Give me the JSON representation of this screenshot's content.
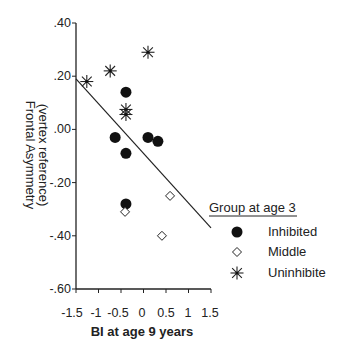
{
  "chart_data": {
    "type": "scatter",
    "title": "",
    "xlabel": "BI at age 9 years",
    "ylabel_line1": "Frontal Asymmetry",
    "ylabel_line2": "(vertex reference)",
    "xlim": [
      -1.5,
      1.5
    ],
    "ylim": [
      -0.6,
      0.4
    ],
    "x_ticks": [
      "-1.5",
      "-1",
      "-0.5",
      "0",
      "0.5",
      "1",
      "1.5"
    ],
    "x_tick_values": [
      -1.5,
      -1,
      -0.5,
      0,
      0.5,
      1,
      1.5
    ],
    "y_ticks": [
      ".40",
      ".20",
      ".00",
      "-.20",
      "-.40",
      "-.60"
    ],
    "y_tick_values": [
      0.4,
      0.2,
      0.0,
      -0.2,
      -0.4,
      -0.6
    ],
    "grid": false,
    "legend": {
      "title": "Group at age 3",
      "position": "right",
      "entries": [
        "Inhibited",
        "Middle",
        "Uninhibite"
      ]
    },
    "series": [
      {
        "name": "Inhibited",
        "marker": "filled-circle",
        "points": [
          [
            -0.39,
            0.14
          ],
          [
            -0.63,
            -0.03
          ],
          [
            -0.39,
            -0.09
          ],
          [
            0.1,
            -0.03
          ],
          [
            0.32,
            -0.045
          ],
          [
            -0.39,
            -0.28
          ]
        ]
      },
      {
        "name": "Middle",
        "marker": "open-diamond",
        "points": [
          [
            -0.41,
            -0.31
          ],
          [
            0.59,
            -0.25
          ],
          [
            0.41,
            -0.4
          ]
        ]
      },
      {
        "name": "Uninhibite",
        "marker": "asterisk",
        "points": [
          [
            -1.26,
            0.18
          ],
          [
            -0.74,
            0.22
          ],
          [
            -0.39,
            0.075
          ],
          [
            -0.39,
            0.056
          ],
          [
            0.1,
            0.29
          ]
        ]
      }
    ],
    "fit_line": {
      "from": [
        -1.5,
        0.19
      ],
      "to": [
        1.5,
        -0.37
      ]
    }
  }
}
